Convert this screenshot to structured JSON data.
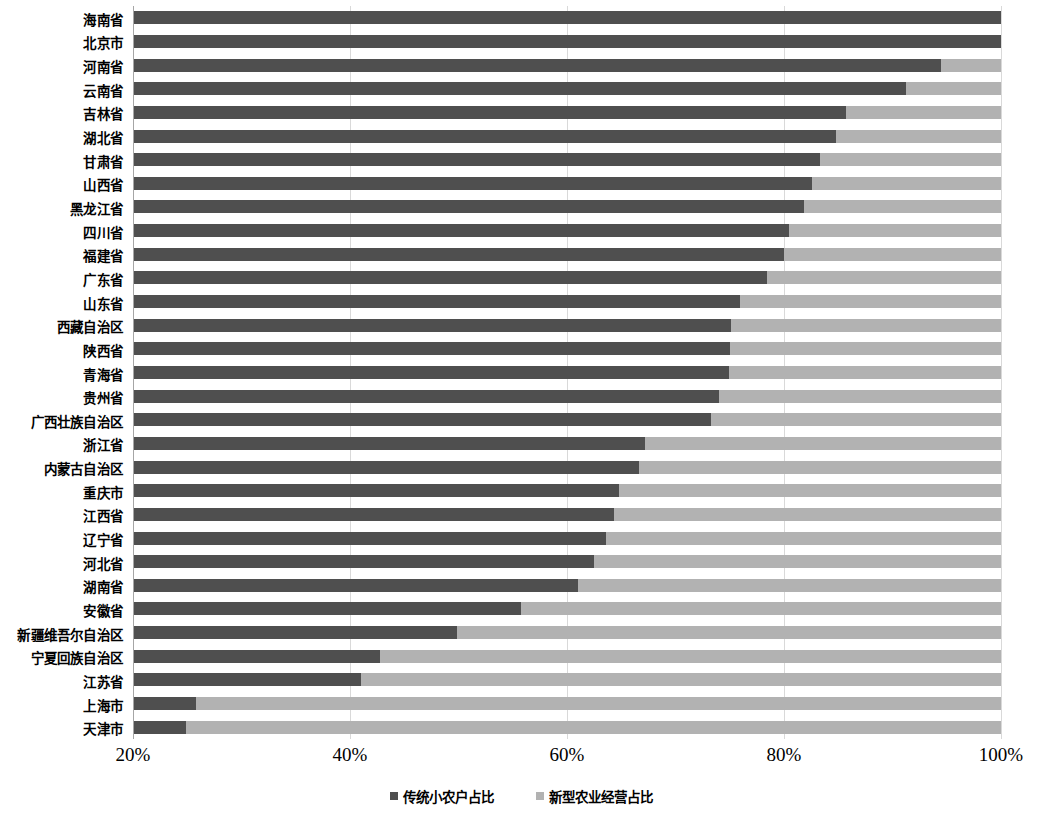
{
  "chart_data": {
    "type": "bar",
    "orientation": "horizontal",
    "stacked": true,
    "stack_total_percent": 100,
    "title": "",
    "subtitle": "",
    "xlabel": "",
    "ylabel": "",
    "xlim": [
      20,
      100
    ],
    "xticks": [
      20,
      40,
      60,
      80,
      100
    ],
    "xtick_labels": [
      "20%",
      "40%",
      "60%",
      "80%",
      "100%"
    ],
    "grid": "vertical",
    "legend_position": "bottom",
    "colors": {
      "traditional": "#4f4f4f",
      "new_type": "#b2b2b2",
      "gridline": "#d9d9d9",
      "axis": "#a6a6a6",
      "background": "#ffffff"
    },
    "series": [
      {
        "name": "传统小农户占比",
        "color": "#4f4f4f",
        "values": [
          100.0,
          100.0,
          94.5,
          91.2,
          85.7,
          84.8,
          83.3,
          82.6,
          81.8,
          80.5,
          80.0,
          78.4,
          75.9,
          75.1,
          75.0,
          74.9,
          74.0,
          73.3,
          67.2,
          66.6,
          64.8,
          64.3,
          63.6,
          62.5,
          61.0,
          55.8,
          49.9,
          42.8,
          41.0,
          25.8,
          24.9
        ]
      },
      {
        "name": "新型农业经营占比",
        "color": "#b2b2b2",
        "values": [
          0.0,
          0.0,
          5.5,
          8.8,
          14.3,
          15.2,
          16.7,
          17.4,
          18.2,
          19.5,
          20.0,
          21.6,
          24.1,
          24.9,
          25.0,
          25.1,
          26.0,
          26.7,
          32.8,
          33.4,
          35.2,
          35.7,
          36.4,
          37.5,
          39.0,
          44.2,
          50.1,
          57.2,
          59.0,
          74.2,
          75.1
        ]
      }
    ],
    "categories": [
      "海南省",
      "北京市",
      "河南省",
      "云南省",
      "吉林省",
      "湖北省",
      "甘肃省",
      "山西省",
      "黑龙江省",
      "四川省",
      "福建省",
      "广东省",
      "山东省",
      "西藏自治区",
      "陕西省",
      "青海省",
      "贵州省",
      "广西壮族自治区",
      "浙江省",
      "内蒙古自治区",
      "重庆市",
      "江西省",
      "辽宁省",
      "河北省",
      "湖南省",
      "安徽省",
      "新疆维吾尔自治区",
      "宁夏回族自治区",
      "江苏省",
      "上海市",
      "天津市"
    ]
  },
  "legend": {
    "items": [
      {
        "label": "传统小农户占比",
        "color": "#4f4f4f"
      },
      {
        "label": "新型农业经营占比",
        "color": "#b2b2b2"
      }
    ]
  }
}
